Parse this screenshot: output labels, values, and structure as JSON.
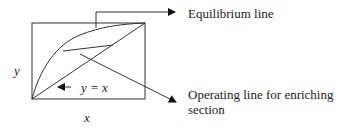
{
  "diagram": {
    "type": "mccabe-thiele-sketch",
    "axis_labels": {
      "x": "x",
      "y": "y"
    },
    "curves": [
      {
        "id": "equilibrium",
        "label": "Equilibrium line"
      },
      {
        "id": "diagonal",
        "label": "y = x"
      },
      {
        "id": "operating",
        "label": "Operating line for enriching section"
      }
    ],
    "callouts": {
      "equilibrium": "Equilibrium line",
      "operating_line1": "Operating line for enriching",
      "operating_line2": "section",
      "diagonal": "y = x"
    },
    "colors": {
      "stroke": "#333333",
      "text": "#222222"
    }
  }
}
